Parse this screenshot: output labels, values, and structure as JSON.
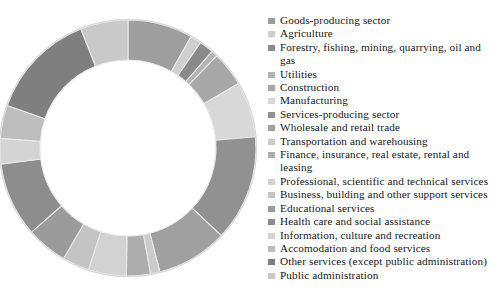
{
  "chart_data": {
    "type": "pie",
    "variant": "donut",
    "title": "",
    "xlabel": "",
    "ylabel": "",
    "grid": false,
    "legend_position": "right",
    "start_angle_deg": 0,
    "direction": "clockwise",
    "inner_radius_ratio": 0.685,
    "categories": [
      "Goods-producing sector",
      "Agriculture",
      "Forestry, fishing, mining, quarrying, oil and gas",
      "Utilities",
      "Construction",
      "Manufacturing",
      "Services-producing sector",
      "Wholesale and retail trade",
      "Transportation and warehousing",
      "Finance, insurance, real estate, rental and leasing",
      "Professional, scientific and technical services",
      "Business, building and other support services",
      "Educational services",
      "Health care and social assistance",
      "Information, culture and recreation",
      "Accomodation and food services",
      "Other services (except public administration)",
      "Public administration"
    ],
    "values": [
      8.2,
      1.4,
      1.8,
      0.8,
      4.4,
      7.0,
      13.4,
      9.0,
      1.2,
      3.0,
      4.8,
      3.4,
      5.2,
      9.4,
      3.2,
      4.2,
      13.6,
      6.0
    ],
    "colors": [
      "#9e9e9e",
      "#cfcfcf",
      "#8a8a8a",
      "#b4b4b4",
      "#a8a8a8",
      "#d8d8d8",
      "#919191",
      "#a0a0a0",
      "#cbcbcb",
      "#adadad",
      "#d2d2d2",
      "#c4c4c4",
      "#9b9b9b",
      "#8d8d8d",
      "#d4d4d4",
      "#bdbdbd",
      "#7f7f7f",
      "#c9c9c9"
    ],
    "slice_stroke": "#e8e8e8",
    "background": "#ffffff"
  },
  "legend": {
    "items": [
      {
        "label": "Goods-producing sector",
        "color": "#9e9e9e"
      },
      {
        "label": "Agriculture",
        "color": "#cfcfcf"
      },
      {
        "label": "Forestry, fishing, mining, quarrying, oil and gas",
        "color": "#8a8a8a"
      },
      {
        "label": "Utilities",
        "color": "#b4b4b4"
      },
      {
        "label": "Construction",
        "color": "#a8a8a8"
      },
      {
        "label": "Manufacturing",
        "color": "#d8d8d8"
      },
      {
        "label": "Services-producing sector",
        "color": "#919191"
      },
      {
        "label": "Wholesale and retail trade",
        "color": "#a0a0a0"
      },
      {
        "label": "Transportation and warehousing",
        "color": "#cbcbcb"
      },
      {
        "label": "Finance, insurance, real estate, rental and leasing",
        "color": "#adadad"
      },
      {
        "label": "Professional, scientific and technical services",
        "color": "#d2d2d2"
      },
      {
        "label": "Business, building and other support services",
        "color": "#c4c4c4"
      },
      {
        "label": "Educational services",
        "color": "#9b9b9b"
      },
      {
        "label": "Health care and social assistance",
        "color": "#8d8d8d"
      },
      {
        "label": "Information, culture and recreation",
        "color": "#d4d4d4"
      },
      {
        "label": "Accomodation and food services",
        "color": "#bdbdbd"
      },
      {
        "label": "Other services (except public administration)",
        "color": "#7f7f7f"
      },
      {
        "label": "Public administration",
        "color": "#c9c9c9"
      }
    ]
  },
  "geometry": {
    "center_x": 128,
    "center_y": 148,
    "outer_radius": 128,
    "inner_radius": 88
  }
}
